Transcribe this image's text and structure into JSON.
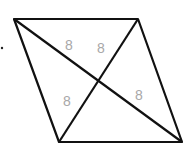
{
  "diagram": {
    "shape": "parallelogram",
    "vertices": {
      "top_left": [
        14,
        19
      ],
      "top_right": [
        138,
        19
      ],
      "bottom_right": [
        182,
        142
      ],
      "bottom_left": [
        59,
        142
      ]
    },
    "diagonals": [
      [
        "top_left",
        "bottom_right"
      ],
      [
        "top_right",
        "bottom_left"
      ]
    ],
    "line_color": "#111111",
    "label_color": "#a8a8a8",
    "labels": [
      {
        "text": "8",
        "x": 69,
        "y": 50
      },
      {
        "text": "8",
        "x": 101,
        "y": 53
      },
      {
        "text": "8",
        "x": 67,
        "y": 106
      },
      {
        "text": "8",
        "x": 139,
        "y": 100
      }
    ],
    "dot": [
      2,
      48
    ]
  }
}
